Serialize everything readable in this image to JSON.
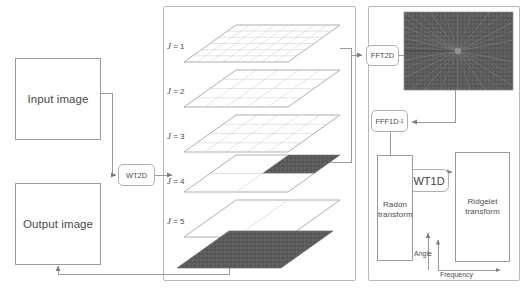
{
  "diagram": {
    "left": {
      "input_box_label": "Input image",
      "output_box_label": "Output image"
    },
    "wt2d": {
      "label": "WT2D"
    },
    "scales_panel": {
      "levels": [
        {
          "label_j": "J",
          "label_eq": " = 1",
          "text": "J = 1",
          "fill": "grid-fine",
          "grid_cols": 8,
          "grid_rows": 6
        },
        {
          "label_j": "J",
          "label_eq": " = 2",
          "text": "J = 2",
          "fill": "grid-medium",
          "grid_cols": 5,
          "grid_rows": 4
        },
        {
          "label_j": "J",
          "label_eq": " = 3",
          "text": "J = 3",
          "fill": "grid-medium",
          "grid_cols": 5,
          "grid_rows": 4
        },
        {
          "label_j": "J",
          "label_eq": " = 4",
          "text": "J = 4",
          "fill": "quadrant-dark",
          "grid_cols": 2,
          "grid_rows": 2
        },
        {
          "label_j": "J",
          "label_eq": " = 5",
          "text": "J = 5",
          "fill": "grid-coarse",
          "grid_cols": 2,
          "grid_rows": 1
        },
        {
          "label_j": "",
          "label_eq": "",
          "text": "",
          "fill": "solid-dark",
          "grid_cols": 1,
          "grid_rows": 1
        }
      ]
    },
    "right": {
      "fft2d_label": "FFT2D",
      "fff1d_label": "FFF1D",
      "fff1d_superscript": "-1",
      "wt1d_label": "WT1D",
      "radon_label_line1": "Radon",
      "radon_label_line2": "transform",
      "ridgelet_label_line1": "Ridgelet",
      "ridgelet_label_line2": "transform",
      "angle_axis_label": "Angle",
      "frequency_axis_label": "Frequency",
      "spectrum_name": "fft2d-magnitude-spectrum"
    },
    "colors": {
      "line": "#9a9a9a",
      "panel_border": "#b8b8b8",
      "text": "#4a4a4a",
      "dark_fill": "#585858",
      "spectrum_base": "#6e6e6e",
      "background": "#ffffff"
    }
  }
}
